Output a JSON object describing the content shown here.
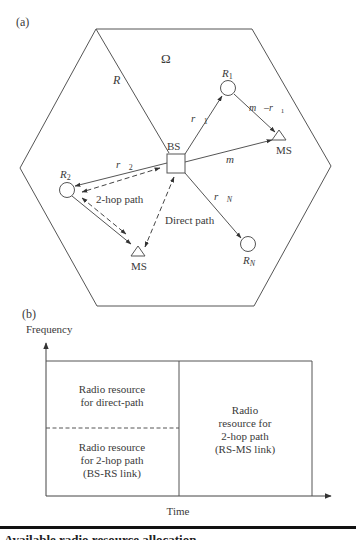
{
  "panel_a": {
    "label": "(a)",
    "region_label": "Ω",
    "radius_label": "R",
    "bs_label": "BS",
    "relays": [
      {
        "name": "R",
        "sub": "1"
      },
      {
        "name": "R",
        "sub": "2"
      },
      {
        "name": "R",
        "sub": "N"
      }
    ],
    "ms_labels": [
      "MS",
      "MS"
    ],
    "vectors": {
      "r1": {
        "name": "r",
        "sub": "1"
      },
      "r2": {
        "name": "r",
        "sub": "2"
      },
      "rN": {
        "name": "r",
        "sub": "N"
      },
      "m": {
        "name": "m"
      },
      "m_minus_r1": {
        "name": "m",
        "op": "–",
        "name2": "r",
        "sub": "1"
      }
    },
    "path_labels": {
      "two_hop": "2-hop path",
      "direct": "Direct path"
    }
  },
  "panel_b": {
    "label": "(b)",
    "y_axis_label": "Frequency",
    "x_axis_label": "Time",
    "blocks": {
      "direct_line1": "Radio resource",
      "direct_line2": "for direct-path",
      "bsrs_line1": "Radio resource",
      "bsrs_line2": "for 2-hop path",
      "bsrs_line3": "(BS-RS link)",
      "rsms_line1": "Radio",
      "rsms_line2": "resource for",
      "rsms_line3": "2-hop path",
      "rsms_line4": "(RS-MS link)"
    }
  },
  "caption_fragment": "Available radio resource allocation"
}
